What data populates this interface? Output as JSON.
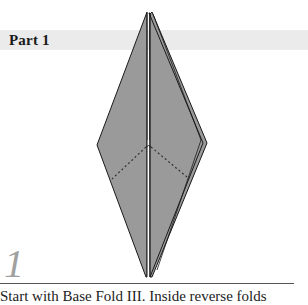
{
  "section": {
    "title": "Part 1"
  },
  "step": {
    "number": "1",
    "instruction": "Start with Base Fold III. Inside reverse folds"
  },
  "diagram": {
    "fill_color": "#9a9a9a",
    "line_color": "#1a1a1a",
    "band_color": "#ebebeb",
    "step_number_color": "#a0a0a0"
  }
}
